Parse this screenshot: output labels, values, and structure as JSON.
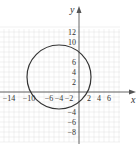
{
  "chart_data": {
    "type": "line",
    "title": "",
    "xlabel": "x",
    "ylabel": "y",
    "xlim": [
      -16,
      8
    ],
    "ylim": [
      -10,
      14
    ],
    "grid": true,
    "x_ticks": [
      -14,
      -10,
      -6,
      -4,
      -2,
      2,
      4,
      6
    ],
    "y_ticks": [
      12,
      10,
      6,
      4,
      2,
      -4,
      -6,
      -8
    ],
    "x_tick_labels": [
      "−14",
      "−10",
      "−6",
      "−4",
      "−2",
      "2",
      "4",
      "6"
    ],
    "y_tick_labels": [
      "12",
      "10",
      "6",
      "4",
      "2",
      "−4",
      "−6",
      "−8"
    ],
    "series": [
      {
        "name": "circle",
        "shape": "circle",
        "center": [
          -4,
          3
        ],
        "radius": 6.4,
        "equation": "(x+4)^2 + (y-3)^2 = 41"
      }
    ]
  },
  "colors": {
    "grid": "#e2e2e2",
    "axis": "#555555",
    "curve": "#333333",
    "text": "#333333"
  }
}
